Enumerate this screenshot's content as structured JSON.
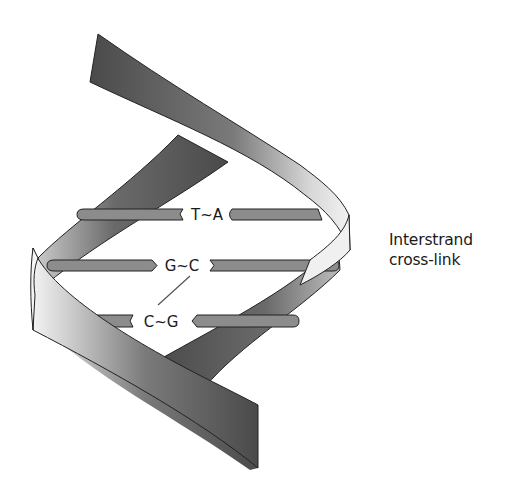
{
  "diagram": {
    "type": "DNA double helix",
    "base_pairs": [
      {
        "label": "T~A",
        "left": "T",
        "right": "A"
      },
      {
        "label": "G~C",
        "left": "G",
        "right": "C"
      },
      {
        "label": "C~G",
        "left": "C",
        "right": "G"
      }
    ],
    "annotation": {
      "line1": "Interstrand",
      "line2": "cross-link"
    },
    "colors": {
      "strand_dark": "#4a4a4a",
      "strand_light": "#e6e6e6",
      "base_bar": "#8c8c8c",
      "outline": "#222222"
    }
  }
}
